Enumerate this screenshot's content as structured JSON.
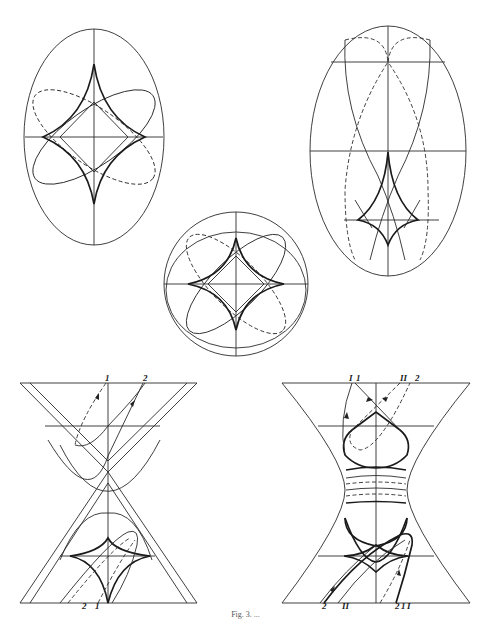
{
  "figure": {
    "caption": "Fig. 3. ...",
    "panels": [
      {
        "id": "ellipse-tall-left",
        "description": "ellipse with astroid caustic and tilted ellipses"
      },
      {
        "id": "circle-center",
        "description": "circle with astroid caustic"
      },
      {
        "id": "ellipse-right",
        "description": "ellipse with off-center caustic"
      },
      {
        "id": "double-cone-left",
        "description": "double cone with trajectories and caustic"
      },
      {
        "id": "hyperboloid-right",
        "description": "hyperboloid with trajectories and caustic"
      }
    ],
    "labels": {
      "cone_top_1": "1",
      "cone_top_2": "2",
      "cone_bottom_2": "2",
      "cone_bottom_1": "1",
      "hyp_top_I": "I",
      "hyp_top_1": "1",
      "hyp_top_II": "II",
      "hyp_top_2": "2",
      "hyp_bottom_2": "2",
      "hyp_bottom_II": "II",
      "hyp_bottom_2b": "2",
      "hyp_bottom_1": "1",
      "hyp_bottom_I": "I"
    }
  }
}
